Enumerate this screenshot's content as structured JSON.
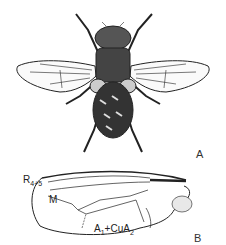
{
  "figure": {
    "panel_a": {
      "label": "A",
      "subject": "fly dorsal view"
    },
    "panel_b": {
      "label": "B",
      "subject": "wing venation",
      "vein_labels": [
        {
          "main": "R",
          "sub": "4+5"
        },
        {
          "main": "M",
          "sub": ""
        },
        {
          "main": "A",
          "sub": "1",
          "join": "+CuA",
          "sub2": "2"
        }
      ]
    }
  }
}
